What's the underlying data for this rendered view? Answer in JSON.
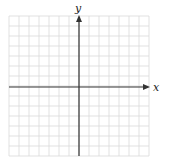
{
  "diagram": {
    "type": "coordinate-plane",
    "grid": {
      "columns": 14,
      "rows": 14,
      "cell_size_px": 10,
      "origin_px": {
        "x": 79,
        "y": 87
      },
      "left_px": 9,
      "top_px": 16,
      "line_color": "#d9d9d9"
    },
    "axes": {
      "color": "#333333",
      "x": {
        "label": "x",
        "arrow": "positive-end"
      },
      "y": {
        "label": "y",
        "arrow": "positive-end"
      }
    },
    "background": "#ffffff"
  }
}
